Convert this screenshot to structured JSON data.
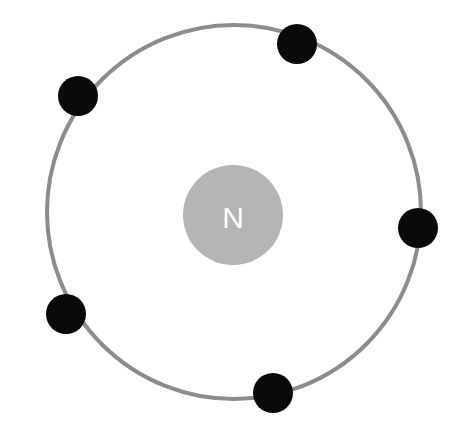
{
  "diagram": {
    "nucleus": {
      "label": "N",
      "cx": 233,
      "cy": 215,
      "r": 50,
      "color": "#b5b5b5"
    },
    "orbit": {
      "cx": 234,
      "cy": 212,
      "r": 187,
      "stroke": "#8c8c8c",
      "stroke_width": 4
    },
    "electron_color": "#0a0a0a",
    "electron_radius": 20,
    "electrons": [
      {
        "cx": 297,
        "cy": 44
      },
      {
        "cx": 78,
        "cy": 96
      },
      {
        "cx": 418,
        "cy": 228
      },
      {
        "cx": 66,
        "cy": 314
      },
      {
        "cx": 273,
        "cy": 393
      }
    ]
  }
}
